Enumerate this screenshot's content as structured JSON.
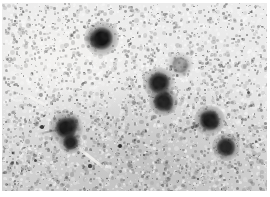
{
  "figure": {
    "title": "",
    "type": "micrograph",
    "width": 270,
    "height": 197
  },
  "plate": {
    "x": 2,
    "y": 3,
    "width": 265,
    "height": 188,
    "background_color": "#e6e6e6",
    "light_region_color": "#f2f1ef",
    "dark_region_color": "#c9c9c9",
    "grain_density": "high",
    "grain_color_light": "#fdfdfd",
    "grain_color_dark": "#9a9a9a"
  },
  "spots": [
    {
      "name": "spot-top-center",
      "cx": 99,
      "cy": 35,
      "r": 8.5,
      "core": "#141414",
      "halo": 9,
      "opacity": 1.0
    },
    {
      "name": "spot-mid-center-upper",
      "cx": 157,
      "cy": 80,
      "r": 8.0,
      "core": "#181818",
      "halo": 8,
      "opacity": 0.97
    },
    {
      "name": "spot-mid-center-lower",
      "cx": 161,
      "cy": 98,
      "r": 7.5,
      "core": "#1a1a1a",
      "halo": 7,
      "opacity": 0.96
    },
    {
      "name": "spot-left-large",
      "cx": 64,
      "cy": 125,
      "r": 8.0,
      "core": "#171717",
      "halo": 9,
      "opacity": 0.98
    },
    {
      "name": "spot-left-small",
      "cx": 68,
      "cy": 139,
      "r": 5.5,
      "core": "#1c1c1c",
      "halo": 6,
      "opacity": 0.95
    },
    {
      "name": "spot-right-upper",
      "cx": 207,
      "cy": 117,
      "r": 7.5,
      "core": "#161616",
      "halo": 8,
      "opacity": 0.98
    },
    {
      "name": "spot-right-lower",
      "cx": 224,
      "cy": 144,
      "r": 7.0,
      "core": "#1d1d1d",
      "halo": 7,
      "opacity": 0.94
    },
    {
      "name": "spot-faint-upper-right",
      "cx": 178,
      "cy": 62,
      "r": 6.0,
      "core": "#6e6e6e",
      "halo": 7,
      "opacity": 0.55
    }
  ],
  "flecks": [
    {
      "name": "fleck-a",
      "cx": 118,
      "cy": 143,
      "r": 2.2,
      "color": "#2f2f2f"
    },
    {
      "name": "fleck-b",
      "cx": 40,
      "cy": 124,
      "r": 1.8,
      "color": "#3a3a3a"
    },
    {
      "name": "fleck-c",
      "cx": 33,
      "cy": 157,
      "r": 1.5,
      "color": "#474747"
    },
    {
      "name": "fleck-d",
      "cx": 88,
      "cy": 163,
      "r": 1.6,
      "color": "#454545"
    },
    {
      "name": "fleck-e",
      "cx": 142,
      "cy": 152,
      "r": 1.4,
      "color": "#4e4e4e"
    },
    {
      "name": "fleck-f",
      "cx": 246,
      "cy": 89,
      "r": 1.5,
      "color": "#555555"
    },
    {
      "name": "fleck-g",
      "cx": 13,
      "cy": 18,
      "r": 1.2,
      "color": "#6a6a6a"
    },
    {
      "name": "fleck-h",
      "cx": 196,
      "cy": 176,
      "r": 1.4,
      "color": "#4a4a4a"
    },
    {
      "name": "fleck-i",
      "cx": 75,
      "cy": 97,
      "r": 1.3,
      "color": "#5c5c5c"
    },
    {
      "name": "fleck-j",
      "cx": 232,
      "cy": 36,
      "r": 1.2,
      "color": "#636363"
    }
  ],
  "streaks": [
    {
      "name": "streak-lower-left",
      "x": 72,
      "y": 140,
      "w": 46,
      "h": 3,
      "angle": 38,
      "color": "#f6f5f3",
      "opacity": 0.85
    },
    {
      "name": "streak-left-upper",
      "x": 20,
      "y": 88,
      "w": 34,
      "h": 3,
      "angle": 28,
      "color": "#f7f6f4",
      "opacity": 0.7
    },
    {
      "name": "streak-right-mid",
      "x": 176,
      "y": 128,
      "w": 30,
      "h": 2,
      "angle": -20,
      "color": "#3c3c3c",
      "opacity": 0.25
    },
    {
      "name": "streak-dark-left",
      "x": 36,
      "y": 130,
      "w": 26,
      "h": 2,
      "angle": -12,
      "color": "#3a3a3a",
      "opacity": 0.3
    }
  ],
  "shading": {
    "top_left_light": "#f4f3f1",
    "bottom_dark": "#c4c4c4",
    "vignette_opacity": 0.35
  }
}
